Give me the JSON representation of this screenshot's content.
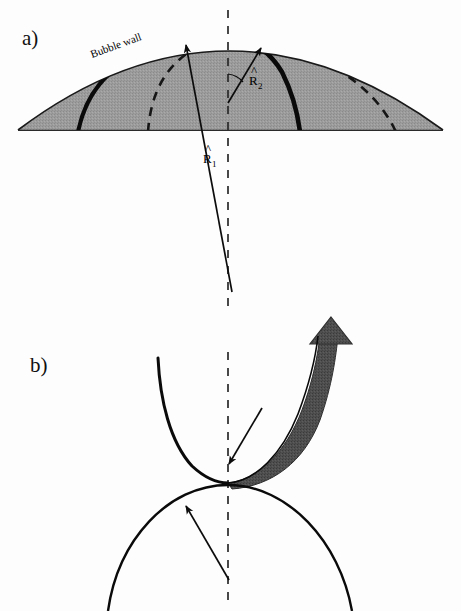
{
  "figure": {
    "background_color": "#fdfdfd",
    "width": 461,
    "height": 611
  },
  "panels": [
    {
      "id": "a",
      "label": "a)",
      "label_pos": [
        22,
        45
      ],
      "annotations": {
        "wall_label": "Bubble wall",
        "vector_1": "R",
        "vector_1_sub": "1",
        "vector_2": "R",
        "vector_2_sub": "2",
        "hat": "^"
      }
    },
    {
      "id": "b",
      "label": "b)",
      "label_pos": [
        30,
        372
      ]
    }
  ],
  "colors": {
    "bubble_fill": "#9a9a9a",
    "bubble_fill_light": "#a5a5a5",
    "stroke": "#000000",
    "jet_arrow": "#4a4a4a",
    "jet_arrow_dark": "#3d3d3d",
    "dash": "#1a1a1a",
    "thin_arc": "#111111"
  },
  "geometry": {
    "panel_a": {
      "baseline_y": 130,
      "dome_apex": [
        228,
        38
      ],
      "dome_left": [
        18,
        130
      ],
      "dome_right": [
        443,
        130
      ],
      "centerline_x": 228,
      "centerline_top": 10,
      "centerline_bottom": 310,
      "thick_arc_left_foot": [
        78,
        130
      ],
      "thick_arc_right_foot": [
        300,
        130
      ],
      "dashed_arc_left_foot": [
        148,
        130
      ],
      "dashed_arc_right_foot": [
        395,
        130
      ],
      "r1_tail": [
        232,
        292
      ],
      "r1_tip": [
        185,
        43
      ],
      "r2_tail": [
        228,
        103
      ],
      "r2_tip": [
        262,
        46
      ]
    },
    "panel_b": {
      "centerline_x": 228,
      "centerline_top": 352,
      "centerline_bottom": 600,
      "jet_meet": [
        228,
        483
      ],
      "jet_left_top": [
        158,
        358
      ],
      "arrow_tip": [
        331,
        318
      ],
      "dome_apex": [
        228,
        485
      ],
      "thin_arrow_upper_tail": [
        262,
        408
      ],
      "thin_arrow_upper_tip": [
        228,
        465
      ],
      "thin_arrow_lower_tail": [
        228,
        580
      ],
      "thin_arrow_lower_tip": [
        185,
        505
      ]
    }
  }
}
